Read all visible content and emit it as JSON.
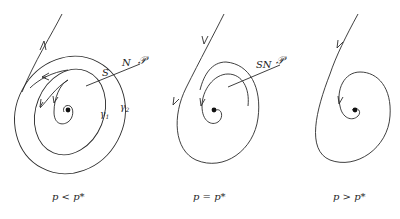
{
  "panels": [
    {
      "id": "left",
      "caption": "p < p*",
      "labels": {
        "S": "S",
        "N": "N",
        "section": "𝒫",
        "gamma1": "γ",
        "gamma1_sub": "1",
        "gamma2": "γ",
        "gamma2_sub": "2"
      }
    },
    {
      "id": "middle",
      "caption": "p = p*",
      "labels": {
        "SN": "SN",
        "section": "𝒫"
      }
    },
    {
      "id": "right",
      "caption": "p > p*",
      "labels": {}
    }
  ],
  "colors": {
    "stroke": "#2a2a2a",
    "background": "#ffffff"
  }
}
